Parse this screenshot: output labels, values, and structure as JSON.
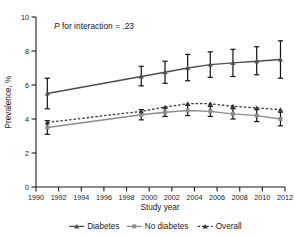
{
  "chart_data": {
    "type": "line",
    "title": "",
    "xlabel": "Study year",
    "ylabel": "Prevalence, %",
    "xlim": [
      1990,
      2012
    ],
    "ylim": [
      0,
      10
    ],
    "xticks": [
      1990,
      1992,
      1994,
      1996,
      1998,
      2000,
      2002,
      2004,
      2006,
      2008,
      2010,
      2012
    ],
    "yticks": [
      0,
      2,
      4,
      6,
      8,
      10
    ],
    "grid": false,
    "legend_position": "below",
    "annotation": {
      "prefix_italic": "P",
      "text": " for interaction = .23",
      "full": "P for interaction = .23",
      "x": 1991.6,
      "y": 9.3
    },
    "series": [
      {
        "name": "Diabetes",
        "style": "solid",
        "marker": "triangle",
        "color": "#4d4d4d",
        "x": [
          1991.0,
          1999.3,
          2001.4,
          2003.4,
          2005.4,
          2007.4,
          2009.5,
          2011.6
        ],
        "values": [
          5.5,
          6.5,
          6.75,
          7.0,
          7.2,
          7.3,
          7.4,
          7.5
        ],
        "err_low": [
          4.6,
          5.95,
          6.1,
          6.25,
          6.45,
          6.5,
          6.6,
          6.4
        ],
        "err_high": [
          6.4,
          7.1,
          7.4,
          7.8,
          7.95,
          8.1,
          8.25,
          8.6
        ]
      },
      {
        "name": "No diabetes",
        "style": "solid",
        "marker": "square",
        "color": "#8c8c8c",
        "x": [
          1991.0,
          1999.3,
          2001.4,
          2003.4,
          2005.4,
          2007.4,
          2009.5,
          2011.6
        ],
        "values": [
          3.5,
          4.25,
          4.4,
          4.5,
          4.45,
          4.3,
          4.2,
          4.0
        ],
        "err_low": [
          3.1,
          3.95,
          4.15,
          4.2,
          4.15,
          4.0,
          3.85,
          3.6
        ],
        "err_high": [
          3.9,
          4.55,
          4.65,
          4.8,
          4.75,
          4.6,
          4.55,
          4.4
        ]
      },
      {
        "name": "Overall",
        "style": "dashed",
        "marker": "triangle",
        "color": "#333333",
        "x": [
          1991.0,
          1999.3,
          2001.4,
          2003.4,
          2005.4,
          2007.4,
          2009.5,
          2011.6
        ],
        "values": [
          3.8,
          4.45,
          4.7,
          4.9,
          4.9,
          4.75,
          4.65,
          4.55
        ],
        "err_low": [
          3.8,
          4.45,
          4.7,
          4.9,
          4.9,
          4.75,
          4.65,
          4.55
        ],
        "err_high": [
          3.8,
          4.45,
          4.7,
          4.9,
          4.9,
          4.75,
          4.65,
          4.55
        ]
      }
    ],
    "legend": [
      {
        "label": "Diabetes",
        "style": "solid",
        "marker": "triangle",
        "color": "#4d4d4d"
      },
      {
        "label": "No diabetes",
        "style": "solid",
        "marker": "square",
        "color": "#8c8c8c"
      },
      {
        "label": "Overall",
        "style": "dashed",
        "marker": "triangle",
        "color": "#333333"
      }
    ]
  }
}
